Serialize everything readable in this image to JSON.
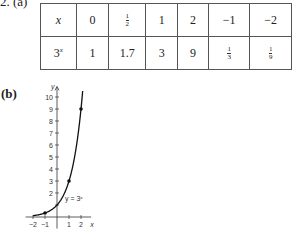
{
  "problem": {
    "number_label": "2. (a)",
    "part_b_label": "(b)"
  },
  "table": {
    "row_headers": [
      "x",
      "3^x"
    ],
    "x_values": [
      "0",
      "1/2",
      "1",
      "2",
      "−1",
      "−2"
    ],
    "y_values": [
      "1",
      "1.7",
      "3",
      "9",
      "1/3",
      "1/9"
    ]
  },
  "chart_data": {
    "type": "line",
    "title": "",
    "xlabel": "x",
    "ylabel": "y",
    "curve_label": "y = 3^x",
    "xlim": [
      -2.2,
      2.6
    ],
    "ylim": [
      -0.8,
      10.8
    ],
    "x_ticks": [
      -2,
      -1,
      1,
      2
    ],
    "x_tick_labels": [
      "−2",
      "−1",
      "1",
      "2"
    ],
    "y_ticks": [
      1,
      2,
      3,
      4,
      5,
      6,
      7,
      8,
      9,
      10
    ],
    "y_tick_labels": [
      "",
      "2",
      "3",
      "4",
      "5",
      "6",
      "7",
      "8",
      "9",
      "10"
    ],
    "series": [
      {
        "name": "y = 3^x",
        "function": "3^x",
        "domain": [
          -2,
          2.15
        ]
      }
    ],
    "points": [
      {
        "x": -1,
        "y": 0.333
      },
      {
        "x": 1,
        "y": 3
      },
      {
        "x": 2,
        "y": 9
      }
    ],
    "grid": false
  }
}
